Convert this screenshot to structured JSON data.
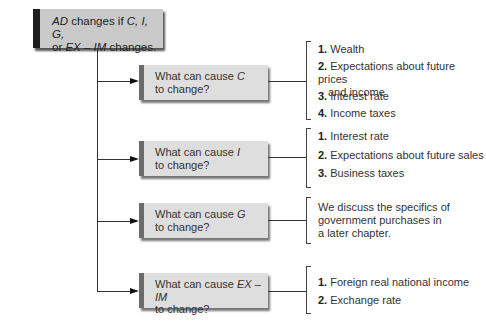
{
  "root": {
    "line1_a": "AD",
    "line1_b": " changes if ",
    "line1_c": "C, I, G,",
    "line2_a": "or ",
    "line2_b": "EX – IM",
    "line2_c": " changes."
  },
  "questions": [
    {
      "prefix": "What can cause ",
      "var": "C",
      "suffix": "to change?",
      "items": [
        {
          "num": "1.",
          "text": "Wealth"
        },
        {
          "num": "2.",
          "text": "Expectations about future prices",
          "text2": "and income"
        },
        {
          "num": "3.",
          "text": "Interest rate"
        },
        {
          "num": "4.",
          "text": "Income taxes"
        }
      ]
    },
    {
      "prefix": "What can cause ",
      "var": "I",
      "suffix": "to change?",
      "items": [
        {
          "num": "1.",
          "text": "Interest rate"
        },
        {
          "num": "2.",
          "text": "Expectations about future sales"
        },
        {
          "num": "3.",
          "text": "Business taxes"
        }
      ]
    },
    {
      "prefix": "What can cause ",
      "var": "G",
      "suffix": "to change?",
      "note": [
        "We discuss the specifics of",
        "government purchases in",
        "a later chapter."
      ]
    },
    {
      "prefix": "What can cause ",
      "var": "EX – IM",
      "suffix": "to change?",
      "items": [
        {
          "num": "1.",
          "text": "Foreign real national income"
        },
        {
          "num": "2.",
          "text": "Exchange rate"
        }
      ]
    }
  ],
  "colors": {
    "root_fill": "#c9c9c9",
    "root_bar": "#1e1e1e",
    "q_fill": "#dedede",
    "q_bar": "#6b6b6b"
  }
}
